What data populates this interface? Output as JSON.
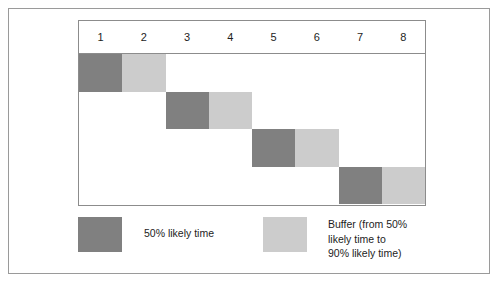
{
  "chart_data": {
    "type": "bar",
    "title": "",
    "subtitle": "",
    "xlabel": "",
    "ylabel": "",
    "orientation": "horizontal",
    "style": "gantt-staircase",
    "grid": false,
    "legend_position": "bottom",
    "axis_ticks": [
      "1",
      "2",
      "3",
      "4",
      "5",
      "6",
      "7",
      "8"
    ],
    "xlim": [
      0,
      8
    ],
    "columns": 8,
    "series": [
      {
        "name": "50% likely time",
        "color": "#808080"
      },
      {
        "name": "Buffer (from 50% likely time to 90% likely time)",
        "color": "#cccccc"
      }
    ],
    "tasks": [
      {
        "row": 1,
        "core_start": 0,
        "core_end": 1,
        "buffer_start": 1,
        "buffer_end": 2
      },
      {
        "row": 2,
        "core_start": 2,
        "core_end": 3,
        "buffer_start": 3,
        "buffer_end": 4
      },
      {
        "row": 3,
        "core_start": 4,
        "core_end": 5,
        "buffer_start": 5,
        "buffer_end": 6
      },
      {
        "row": 4,
        "core_start": 6,
        "core_end": 7,
        "buffer_start": 7,
        "buffer_end": 8
      }
    ]
  },
  "table": {
    "headers": [
      {
        "label": "1"
      },
      {
        "label": "2"
      },
      {
        "label": "3"
      },
      {
        "label": "4"
      },
      {
        "label": "5"
      },
      {
        "label": "6"
      },
      {
        "label": "7"
      },
      {
        "label": "8"
      }
    ]
  },
  "legend": {
    "items": [
      {
        "label": "50% likely time",
        "color": "#808080"
      },
      {
        "label": "Buffer (from 50%\nlikely time to\n90% likely time)",
        "color": "#cccccc"
      }
    ]
  },
  "colors": {
    "core": "#808080",
    "buffer": "#cccccc",
    "frame_border": "#9a9a9a",
    "table_border": "#8c8c8c",
    "background": "#ffffff",
    "text": "#1d1d1d"
  }
}
